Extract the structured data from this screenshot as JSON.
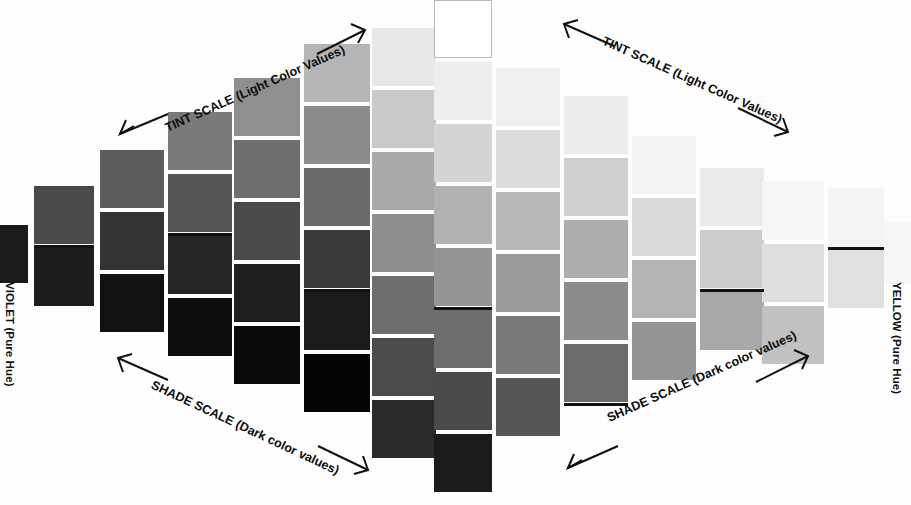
{
  "figure": {
    "background": "#fefefe",
    "rule_color": "#111111",
    "text_color": "#0d0d0d",
    "width": 911,
    "height": 505
  },
  "hue_labels": {
    "left": {
      "name": "VIOLET",
      "qualifier": "(Pure Hue)",
      "full": "VIOLET (Pure Hue)"
    },
    "right": {
      "name": "YELLOW",
      "qualifier": "(Pure Hue)",
      "full": "YELLOW (Pure Hue)"
    }
  },
  "scale_labels": {
    "tint_left": {
      "caps": "TINT SCALE ",
      "paren": "(Light Color Values)",
      "full": "TINT SCALE (Light Color Values)"
    },
    "tint_right": {
      "caps": "TINT SCALE ",
      "paren": "(Light Color Values)",
      "full": "TINT SCALE (Light Color Values)"
    },
    "shade_left": {
      "caps": "SHADE SCALE ",
      "paren": "(Dark color values)",
      "full": "SHADE SCALE (Dark color values)"
    },
    "shade_right": {
      "caps": "SHADE SCALE ",
      "paren": "(Dark color values)",
      "full": "SHADE SCALE (Dark color values)"
    }
  },
  "chart_data": {
    "type": "heatmap",
    "xlabel": "Hue position (Violet → Yellow)",
    "ylabel": "Value (light → dark)",
    "legend_position": "none",
    "grid": false,
    "endpoint_left": "VIOLET (Pure Hue)",
    "endpoint_right": "YELLOW (Pure Hue)",
    "columns": [
      {
        "index": 0,
        "x": 0,
        "top": 225,
        "w": 28,
        "cell_w": 28,
        "cell_h": 58,
        "gap": 4,
        "rule": false,
        "rule_after_index": -1,
        "values": [
          "#1a1a1a"
        ]
      },
      {
        "index": 1,
        "x": 34,
        "top": 186,
        "w": 60,
        "cell_w": 60,
        "cell_h": 58,
        "gap": 4,
        "rule": true,
        "rule_after_index": 0,
        "values": [
          "#4b4b4b",
          "#1c1c1c"
        ]
      },
      {
        "index": 2,
        "x": 100,
        "top": 150,
        "w": 64,
        "cell_w": 64,
        "cell_h": 58,
        "gap": 4,
        "rule": false,
        "rule_after_index": -1,
        "values": [
          "#5c5c5c",
          "#333333",
          "#111111"
        ]
      },
      {
        "index": 3,
        "x": 168,
        "top": 112,
        "w": 64,
        "cell_w": 64,
        "cell_h": 58,
        "gap": 4,
        "rule": true,
        "rule_after_index": 1,
        "values": [
          "#7a7a7a",
          "#565656",
          "#262626",
          "#0d0d0d"
        ]
      },
      {
        "index": 4,
        "x": 234,
        "top": 78,
        "w": 66,
        "cell_w": 66,
        "cell_h": 58,
        "gap": 4,
        "rule": false,
        "rule_after_index": -1,
        "values": [
          "#8f8f8f",
          "#6e6e6e",
          "#4a4a4a",
          "#1f1f1f",
          "#090909"
        ]
      },
      {
        "index": 5,
        "x": 304,
        "top": 44,
        "w": 66,
        "cell_w": 66,
        "cell_h": 58,
        "gap": 4,
        "rule": true,
        "rule_after_index": 3,
        "values": [
          "#b5b5b5",
          "#8b8b8b",
          "#6a6a6a",
          "#3b3b3b",
          "#1a1a1a",
          "#050505"
        ]
      },
      {
        "index": 6,
        "x": 372,
        "top": 28,
        "w": 64,
        "cell_w": 64,
        "cell_h": 58,
        "gap": 4,
        "rule": false,
        "rule_after_index": -1,
        "values": [
          "#e7e7e7",
          "#c9c9c9",
          "#a9a9a9",
          "#8e8e8e",
          "#6d6d6d",
          "#4c4c4c",
          "#2a2a2a"
        ]
      },
      {
        "index": 7,
        "x": 434,
        "top": 0,
        "w": 58,
        "cell_w": 58,
        "cell_h": 58,
        "gap": 4,
        "rule": true,
        "rule_after_index": 4,
        "outlined_first": true,
        "values": [
          "#ffffff",
          "#ededed",
          "#d4d4d4",
          "#b2b2b2",
          "#949494",
          "#6e6e6e",
          "#4a4a4a",
          "#1b1b1b"
        ]
      },
      {
        "index": 8,
        "x": 496,
        "top": 68,
        "w": 64,
        "cell_w": 64,
        "cell_h": 58,
        "gap": 4,
        "rule": false,
        "rule_after_index": -1,
        "values": [
          "#f0f0f0",
          "#dcdcdc",
          "#b9b9b9",
          "#9a9a9a",
          "#797979",
          "#565656"
        ]
      },
      {
        "index": 9,
        "x": 564,
        "top": 96,
        "w": 64,
        "cell_w": 64,
        "cell_h": 58,
        "gap": 4,
        "rule": true,
        "rule_after_index": 4,
        "values": [
          "#ececec",
          "#cfcfcf",
          "#adadad",
          "#8b8b8b",
          "#6b6b6b"
        ]
      },
      {
        "index": 10,
        "x": 632,
        "top": 136,
        "w": 64,
        "cell_w": 64,
        "cell_h": 58,
        "gap": 4,
        "rule": false,
        "rule_after_index": -1,
        "values": [
          "#f2f2f2",
          "#d9d9d9",
          "#b4b4b4",
          "#949494"
        ]
      },
      {
        "index": 11,
        "x": 700,
        "top": 168,
        "w": 64,
        "cell_w": 64,
        "cell_h": 58,
        "gap": 4,
        "rule": true,
        "rule_after_index": 1,
        "values": [
          "#e9e9e9",
          "#cdcdcd",
          "#a8a8a8"
        ]
      },
      {
        "index": 12,
        "x": 762,
        "top": 182,
        "w": 62,
        "cell_w": 62,
        "cell_h": 58,
        "gap": 4,
        "rule": false,
        "rule_after_index": -1,
        "values": [
          "#f6f6f6",
          "#dedede",
          "#c2c2c2"
        ]
      },
      {
        "index": 13,
        "x": 828,
        "top": 188,
        "w": 56,
        "cell_w": 56,
        "cell_h": 58,
        "gap": 4,
        "rule": true,
        "rule_after_index": 0,
        "values": [
          "#f4f4f4",
          "#e0e0e0"
        ]
      },
      {
        "index": 14,
        "x": 884,
        "top": 222,
        "w": 27,
        "cell_w": 27,
        "cell_h": 62,
        "gap": 4,
        "rule": false,
        "rule_after_index": -1,
        "values": [
          "#f7f7f7"
        ]
      }
    ],
    "notes": [
      "Swatches form a lens/diamond arc: lightest (white) at top center, darkest (black) at bottom center.",
      "A black horizontal rule marks the mid value line across the chart at roughly y = 246.",
      "Left end is VIOLET pure hue (very dark value); right end is YELLOW pure hue (very light value)."
    ]
  }
}
